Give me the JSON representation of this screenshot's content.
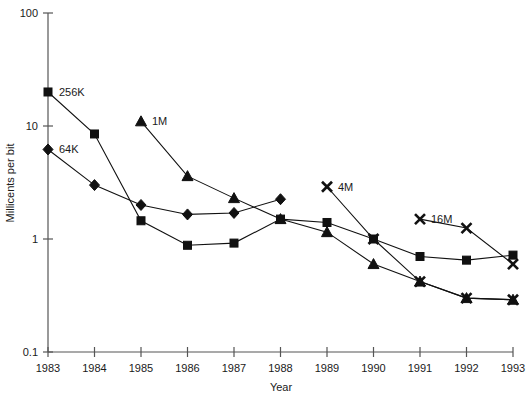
{
  "chart_data": {
    "type": "line",
    "title": "",
    "xlabel": "Year",
    "ylabel": "Millicents per bit",
    "x": [
      1983,
      1984,
      1985,
      1986,
      1987,
      1988,
      1989,
      1990,
      1991,
      1992,
      1993
    ],
    "x_tick_labels": [
      "1983",
      "1984",
      "1985",
      "1986",
      "1987",
      "1988",
      "1989",
      "1990",
      "1991",
      "1992",
      "1993"
    ],
    "xlim": [
      1983,
      1993
    ],
    "y_scale": "log",
    "ylim": [
      0.1,
      100
    ],
    "y_tick_labels": [
      "100",
      "10",
      "1",
      "0.1"
    ],
    "y_ticks": [
      100,
      10,
      1,
      0.1
    ],
    "grid": false,
    "legend": "inline-labels",
    "series": [
      {
        "name": "256K",
        "marker": "square",
        "label_at_x": 1983,
        "x": [
          1983,
          1984,
          1985,
          1986,
          1987,
          1988,
          1989,
          1990,
          1991,
          1992,
          1993
        ],
        "values": [
          20,
          8.5,
          1.45,
          0.88,
          0.92,
          1.5,
          1.4,
          1.0,
          0.7,
          0.65,
          0.72
        ]
      },
      {
        "name": "64K",
        "marker": "diamond",
        "label_at_x": 1983,
        "x": [
          1983,
          1984,
          1985,
          1986,
          1987,
          1988
        ],
        "values": [
          6.2,
          3.0,
          2.0,
          1.65,
          1.7,
          2.25
        ]
      },
      {
        "name": "1M",
        "marker": "triangle",
        "label_at_x": 1985,
        "x": [
          1985,
          1986,
          1987,
          1988,
          1989,
          1990,
          1991,
          1992,
          1993
        ],
        "values": [
          11.0,
          3.6,
          2.3,
          1.5,
          1.15,
          0.6,
          0.42,
          0.3,
          0.29
        ]
      },
      {
        "name": "4M",
        "marker": "cross",
        "label_at_x": 1989,
        "x": [
          1989,
          1990,
          1991,
          1992,
          1993
        ],
        "values": [
          2.9,
          1.0,
          0.42,
          0.3,
          0.29
        ]
      },
      {
        "name": "16M",
        "marker": "cross",
        "label_at_x": 1991,
        "x": [
          1991,
          1992,
          1993
        ],
        "values": [
          1.5,
          1.25,
          0.6
        ]
      }
    ],
    "annotations": [
      {
        "text": "256K",
        "x": 1983,
        "y": 20
      },
      {
        "text": "64K",
        "x": 1983,
        "y": 6.2
      },
      {
        "text": "1M",
        "x": 1985,
        "y": 11.0
      },
      {
        "text": "4M",
        "x": 1989,
        "y": 2.9
      },
      {
        "text": "16M",
        "x": 1991,
        "y": 1.5
      }
    ]
  },
  "colors": {
    "ink": "#111111",
    "axis": "#555555",
    "background": "#ffffff"
  }
}
